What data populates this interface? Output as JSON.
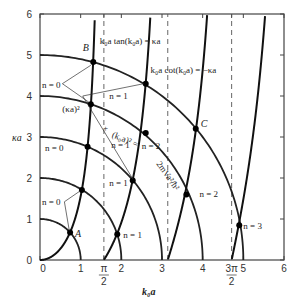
{
  "chart_data": {
    "type": "line",
    "title": "",
    "xlabel": "k0a",
    "ylabel": "κa",
    "xlim": [
      0,
      6
    ],
    "ylim": [
      0,
      6
    ],
    "grid": false,
    "x_ticks": [
      "0",
      "1",
      "π/2",
      "2",
      "3",
      "4",
      "3π/2",
      "5",
      "6"
    ],
    "y_ticks": [
      "0",
      "1",
      "2",
      "3",
      "4",
      "5",
      "6"
    ],
    "dashed_lines_x": [
      1.5708,
      3.1416,
      4.7124
    ],
    "circles": {
      "equation": "(κa)² + (k0a)² = 2mVa²/ħ²",
      "radii": [
        1,
        2,
        3,
        4,
        5
      ]
    },
    "series": [
      {
        "name": "k0a tan(k0a) = κa",
        "branches": [
          "0 < k0a < π/2",
          "π < k0a < 3π/2"
        ]
      },
      {
        "name": "k0a cot(k0a) = −κa",
        "branches": [
          "π/2 < k0a < π",
          "3π/2 < k0a < 2π"
        ]
      }
    ],
    "intersections": [
      {
        "label": "A",
        "n": 0,
        "radius": 1,
        "x": 0.74,
        "y": 0.67
      },
      {
        "label": "",
        "n": 0,
        "radius": 2,
        "x": 1.03,
        "y": 1.71
      },
      {
        "label": "",
        "n": 1,
        "radius": 2,
        "x": 1.9,
        "y": 0.63
      },
      {
        "label": "",
        "n": 0,
        "radius": 3,
        "x": 1.17,
        "y": 2.76
      },
      {
        "label": "",
        "n": 1,
        "radius": 3,
        "x": 2.28,
        "y": 1.94
      },
      {
        "label": "",
        "n": 0,
        "radius": 4,
        "x": 1.25,
        "y": 3.8
      },
      {
        "label": "",
        "n": 1,
        "radius": 4,
        "x": 2.6,
        "y": 3.1
      },
      {
        "label": "",
        "n": 2,
        "radius": 4,
        "x": 3.6,
        "y": 1.6
      },
      {
        "label": "B",
        "n": 0,
        "radius": 5,
        "x": 1.31,
        "y": 4.83
      },
      {
        "label": "",
        "n": 1,
        "radius": 5,
        "x": 2.6,
        "y": 4.3
      },
      {
        "label": "C",
        "n": 2,
        "radius": 5,
        "x": 3.83,
        "y": 3.2
      },
      {
        "label": "",
        "n": 3,
        "radius": 5,
        "x": 4.9,
        "y": 0.85
      }
    ],
    "annotations": [
      "k0a tan(k0a) = κa",
      "k0a cot(k0a) = −κa",
      "(κa)² + (k0a)² = 2mVa²/ħ²",
      "n = 0",
      "n = 1",
      "n = 2",
      "n = 3",
      "A",
      "B",
      "C"
    ]
  },
  "labels": {
    "tan_curve": "k₀a tan(k₀a) = κa",
    "cot_curve": "k₀a cot(k₀a) = −κa",
    "circle_eq_1": "(κa)²",
    "circle_eq_2": "+",
    "circle_eq_3": "(k₀a)² =",
    "circle_eq_4": "2mVa²/ħ²",
    "xlabel": "k₀a",
    "ylabel": "κa",
    "A": "A",
    "B": "B",
    "C": "C",
    "n0": "n = 0",
    "n1": "n = 1",
    "n2": "n = 2",
    "n3": "n = 3"
  }
}
